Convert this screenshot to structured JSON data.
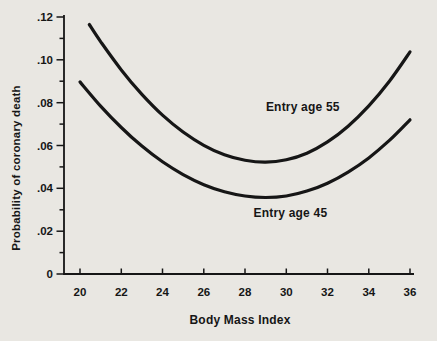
{
  "figure": {
    "background_color": "#e9e7e2",
    "ink_color": "#161616"
  },
  "chart_data": {
    "type": "line",
    "title": "",
    "xlabel": "Body Mass Index",
    "ylabel": "Probability of coronary death",
    "xlim": [
      19.2,
      36.2
    ],
    "ylim": [
      0,
      0.12
    ],
    "grid": false,
    "legend_position": "inline-annotations",
    "x_ticks": [
      {
        "value": 20,
        "label": "20"
      },
      {
        "value": 22,
        "label": "22"
      },
      {
        "value": 24,
        "label": "24"
      },
      {
        "value": 26,
        "label": "26"
      },
      {
        "value": 28,
        "label": "28"
      },
      {
        "value": 30,
        "label": "30"
      },
      {
        "value": 32,
        "label": "32"
      },
      {
        "value": 34,
        "label": "34"
      },
      {
        "value": 36,
        "label": "36"
      }
    ],
    "y_ticks": [
      {
        "value": 0,
        "label": "0"
      },
      {
        "value": 0.02,
        "label": ".02"
      },
      {
        "value": 0.04,
        "label": ".04"
      },
      {
        "value": 0.06,
        "label": ".06"
      },
      {
        "value": 0.08,
        "label": ".08"
      },
      {
        "value": 0.1,
        "label": ".10"
      },
      {
        "value": 0.12,
        "label": ".12"
      }
    ],
    "y_minor_ticks": [
      0.01,
      0.03,
      0.05,
      0.07,
      0.09,
      0.11
    ],
    "series": [
      {
        "name": "Entry age 55",
        "points": [
          [
            20.45,
            0.1165
          ],
          [
            21,
            0.1085
          ],
          [
            22,
            0.0953
          ],
          [
            23,
            0.0839
          ],
          [
            24,
            0.0742
          ],
          [
            25,
            0.0663
          ],
          [
            26,
            0.0601
          ],
          [
            27,
            0.0557
          ],
          [
            28,
            0.0531
          ],
          [
            29,
            0.0522
          ],
          [
            30,
            0.0533
          ],
          [
            31,
            0.0564
          ],
          [
            32,
            0.0617
          ],
          [
            33,
            0.069
          ],
          [
            34,
            0.0785
          ],
          [
            35,
            0.09
          ],
          [
            36,
            0.1037
          ]
        ]
      },
      {
        "name": "Entry age 45",
        "points": [
          [
            20,
            0.0897
          ],
          [
            21,
            0.0784
          ],
          [
            22,
            0.0684
          ],
          [
            23,
            0.0597
          ],
          [
            24,
            0.0524
          ],
          [
            25,
            0.0464
          ],
          [
            26,
            0.0417
          ],
          [
            27,
            0.0384
          ],
          [
            28,
            0.0364
          ],
          [
            29,
            0.0357
          ],
          [
            30,
            0.0364
          ],
          [
            31,
            0.0387
          ],
          [
            32,
            0.0424
          ],
          [
            33,
            0.0476
          ],
          [
            34,
            0.0542
          ],
          [
            35,
            0.0624
          ],
          [
            36,
            0.072
          ]
        ]
      }
    ],
    "annotations": [
      {
        "text": "Entry age 55",
        "x": 30.8,
        "y": 0.078
      },
      {
        "text": "Entry age 45",
        "x": 30.2,
        "y": 0.0285
      }
    ]
  }
}
